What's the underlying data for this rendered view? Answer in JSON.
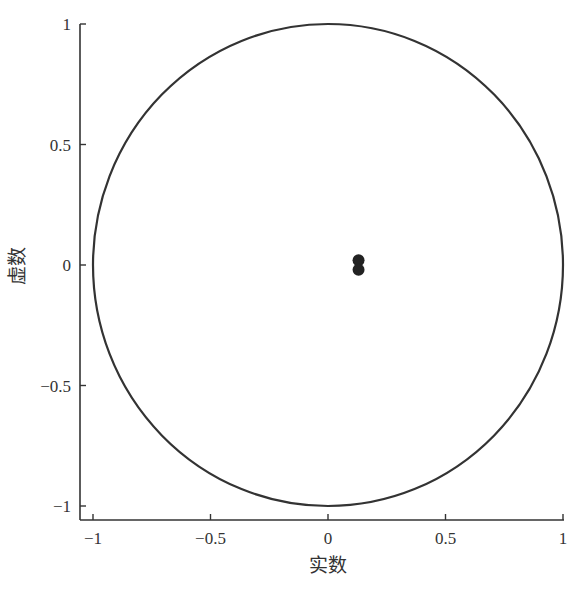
{
  "chart_data": {
    "type": "scatter",
    "title": "",
    "xlabel": "实数",
    "ylabel": "虚数",
    "xlim": [
      -1.03,
      1
    ],
    "ylim": [
      -1.05,
      1
    ],
    "x_ticks": [
      -1,
      -0.5,
      0,
      0.5,
      1
    ],
    "x_tick_labels": [
      "−1",
      "−0.5",
      "0",
      "0.5",
      "1"
    ],
    "y_ticks": [
      -1,
      -0.5,
      0,
      0.5,
      1
    ],
    "y_tick_labels": [
      "−1",
      "−0.5",
      "0",
      "0.5",
      "1"
    ],
    "grid": false,
    "legend": null,
    "unit_circle": {
      "center": [
        0,
        0
      ],
      "radius": 1,
      "color": "#333333"
    },
    "series": [
      {
        "name": "poles",
        "marker": "filled-circle",
        "color": "#222222",
        "points": [
          {
            "x": 0.13,
            "y": 0.02
          },
          {
            "x": 0.13,
            "y": -0.02
          }
        ]
      }
    ]
  }
}
